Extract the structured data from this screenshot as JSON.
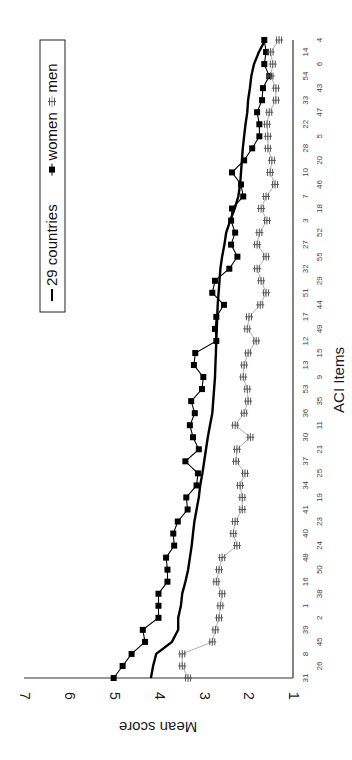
{
  "chart_data": {
    "type": "line",
    "orientation": "rotated-90-ccw",
    "title": "",
    "xlabel": "ACI Items",
    "ylabel": "Mean score",
    "ylim": [
      1,
      7
    ],
    "yticks": [
      "1",
      "2",
      "3",
      "4",
      "5",
      "6",
      "7"
    ],
    "grid": false,
    "legend_position": "top-inside",
    "categories": [
      "31",
      "26",
      "8",
      "45",
      "39",
      "2",
      "1",
      "38",
      "16",
      "50",
      "48",
      "24",
      "40",
      "23",
      "41",
      "19",
      "34",
      "25",
      "37",
      "21",
      "30",
      "11",
      "36",
      "35",
      "53",
      "9",
      "13",
      "15",
      "12",
      "49",
      "17",
      "44",
      "51",
      "29",
      "32",
      "55",
      "27",
      "52",
      "3",
      "18",
      "7",
      "46",
      "10",
      "20",
      "28",
      "5",
      "22",
      "47",
      "33",
      "43",
      "54",
      "6",
      "14",
      "4"
    ],
    "series": [
      {
        "name": "29 countries",
        "marker": "none",
        "color": "#000000",
        "values": [
          4.17,
          4.12,
          4.05,
          3.7,
          3.56,
          3.56,
          3.5,
          3.47,
          3.4,
          3.34,
          3.3,
          3.26,
          3.23,
          3.2,
          3.15,
          3.1,
          3.07,
          3.02,
          2.98,
          2.94,
          2.9,
          2.85,
          2.8,
          2.78,
          2.76,
          2.74,
          2.73,
          2.72,
          2.71,
          2.7,
          2.69,
          2.68,
          2.66,
          2.64,
          2.62,
          2.58,
          2.53,
          2.49,
          2.4,
          2.3,
          2.22,
          2.18,
          2.16,
          2.14,
          2.12,
          2.09,
          2.06,
          2.02,
          2.0,
          1.96,
          1.93,
          1.87,
          1.76,
          1.62
        ]
      },
      {
        "name": "women",
        "marker": "square",
        "color": "#000000",
        "values": [
          5.0,
          4.8,
          4.6,
          4.3,
          4.35,
          4.0,
          4.0,
          4.0,
          3.8,
          3.8,
          3.83,
          3.65,
          3.67,
          3.57,
          3.35,
          3.38,
          3.15,
          3.12,
          3.4,
          3.1,
          3.23,
          3.3,
          3.19,
          3.27,
          3.03,
          3.0,
          3.21,
          3.18,
          2.71,
          2.74,
          2.71,
          2.54,
          2.8,
          2.74,
          2.42,
          2.24,
          2.38,
          2.29,
          2.38,
          2.36,
          2.11,
          2.16,
          2.36,
          2.09,
          1.91,
          1.75,
          1.75,
          1.8,
          1.69,
          1.67,
          1.53,
          1.64,
          1.6,
          1.64
        ]
      },
      {
        "name": "men",
        "marker": "asterisk",
        "color": "#555555",
        "values": [
          3.34,
          3.47,
          3.47,
          2.8,
          2.73,
          2.65,
          2.62,
          2.58,
          2.71,
          2.65,
          2.58,
          2.25,
          2.33,
          2.29,
          2.13,
          2.13,
          2.18,
          2.07,
          2.27,
          2.25,
          1.95,
          2.29,
          2.09,
          2.0,
          2.02,
          2.11,
          2.09,
          2.0,
          1.82,
          2.02,
          1.98,
          1.73,
          1.6,
          1.71,
          1.8,
          1.6,
          1.8,
          1.75,
          1.58,
          1.71,
          1.6,
          1.4,
          1.51,
          1.47,
          1.56,
          1.56,
          1.58,
          1.53,
          1.38,
          1.38,
          1.5,
          1.45,
          1.5,
          1.31
        ]
      }
    ]
  },
  "legend": {
    "items": [
      {
        "label": "29 countries",
        "marker": "line"
      },
      {
        "label": "women",
        "marker": "square"
      },
      {
        "label": "men",
        "marker": "asterisk"
      }
    ]
  },
  "axes": {
    "value_axis_title": "Mean score",
    "category_axis_title": "ACI Items"
  }
}
